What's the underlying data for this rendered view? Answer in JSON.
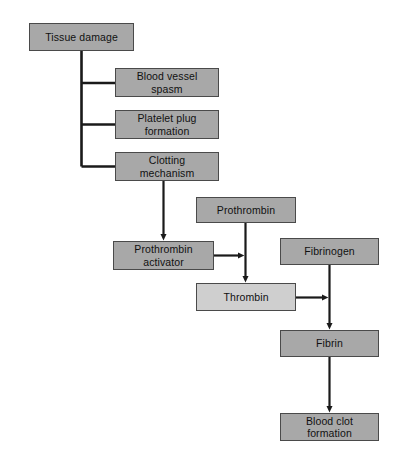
{
  "diagram": {
    "colors": {
      "box_fill": "#a8a8a8",
      "box_fill_light": "#cfcfcf",
      "box_border": "#4a4a4a",
      "connector": "#1a1a1a",
      "background": "#ffffff",
      "text": "#111111"
    },
    "nodes": [
      {
        "id": "tissue-damage",
        "label": "Tissue damage",
        "x": 29,
        "y": 23,
        "w": 105,
        "h": 28,
        "shade": "dark"
      },
      {
        "id": "blood-vessel-spasm",
        "label": "Blood vessel\nspasm",
        "x": 115,
        "y": 68,
        "w": 104,
        "h": 29,
        "shade": "dark"
      },
      {
        "id": "platelet-plug-formation",
        "label": "Platelet plug\nformation",
        "x": 115,
        "y": 110,
        "w": 104,
        "h": 29,
        "shade": "dark"
      },
      {
        "id": "clotting-mechanism",
        "label": "Clotting\nmechanism",
        "x": 115,
        "y": 152,
        "w": 104,
        "h": 29,
        "shade": "dark"
      },
      {
        "id": "prothrombin",
        "label": "Prothrombin",
        "x": 196,
        "y": 197,
        "w": 100,
        "h": 26,
        "shade": "dark"
      },
      {
        "id": "prothrombin-activator",
        "label": "Prothrombin\nactivator",
        "x": 113,
        "y": 241,
        "w": 101,
        "h": 29,
        "shade": "dark"
      },
      {
        "id": "fibrinogen",
        "label": "Fibrinogen",
        "x": 280,
        "y": 238,
        "w": 99,
        "h": 27,
        "shade": "dark"
      },
      {
        "id": "thrombin",
        "label": "Thrombin",
        "x": 196,
        "y": 283,
        "w": 100,
        "h": 28,
        "shade": "light"
      },
      {
        "id": "fibrin",
        "label": "Fibrin",
        "x": 280,
        "y": 330,
        "w": 99,
        "h": 27,
        "shade": "dark"
      },
      {
        "id": "blood-clot-formation",
        "label": "Blood clot\nformation",
        "x": 280,
        "y": 413,
        "w": 99,
        "h": 28,
        "shade": "dark"
      }
    ],
    "edges": [
      {
        "id": "tissue-to-spasm",
        "from": "tissue-damage",
        "to": "blood-vessel-spasm",
        "type": "elbow-plain"
      },
      {
        "id": "tissue-to-platelet",
        "from": "tissue-damage",
        "to": "platelet-plug-formation",
        "type": "elbow-plain"
      },
      {
        "id": "tissue-to-clotting",
        "from": "tissue-damage",
        "to": "clotting-mechanism",
        "type": "elbow-plain"
      },
      {
        "id": "clotting-to-activator",
        "from": "clotting-mechanism",
        "to": "prothrombin-activator",
        "type": "arrow-down"
      },
      {
        "id": "prothrombin-to-thrombin",
        "from": "prothrombin",
        "to": "thrombin",
        "type": "arrow-down"
      },
      {
        "id": "activator-to-prothrombin-line",
        "from": "prothrombin-activator",
        "to": "prothrombin-to-thrombin",
        "type": "arrow-right"
      },
      {
        "id": "fibrinogen-to-fibrin",
        "from": "fibrinogen",
        "to": "fibrin",
        "type": "arrow-down"
      },
      {
        "id": "thrombin-to-fibrinogen-line",
        "from": "thrombin",
        "to": "fibrinogen-to-fibrin",
        "type": "arrow-right"
      },
      {
        "id": "fibrin-to-blood-clot",
        "from": "fibrin",
        "to": "blood-clot-formation",
        "type": "arrow-down"
      }
    ]
  }
}
